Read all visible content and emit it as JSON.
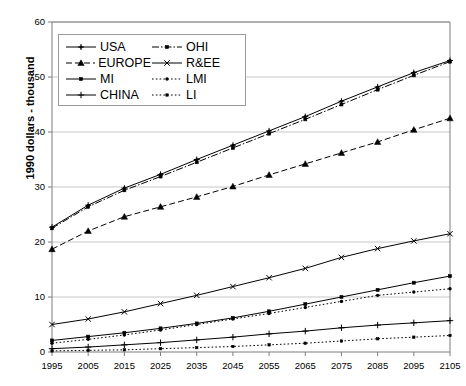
{
  "chart_data": {
    "type": "line",
    "title": "",
    "xlabel": "",
    "ylabel": "1990 dollars - thousand",
    "x": [
      1995,
      2005,
      2015,
      2025,
      2035,
      2045,
      2055,
      2065,
      2075,
      2085,
      2095,
      2105
    ],
    "xticklabels": [
      "1995",
      "2005",
      "2015",
      "2025",
      "2035",
      "2045",
      "2055",
      "2065",
      "2075",
      "2085",
      "2095",
      "2105"
    ],
    "yticklabels": [
      "0",
      "10",
      "20",
      "30",
      "40",
      "50",
      "60"
    ],
    "yticks": [
      0,
      10,
      20,
      30,
      40,
      50,
      60
    ],
    "ylim": [
      0,
      60
    ],
    "xlim": [
      1995,
      2105
    ],
    "grid": "horizontal",
    "legend_position": "upper-left-inside",
    "series": [
      {
        "name": "USA",
        "marker": "plus-dot",
        "dash": "solid",
        "values": [
          22.7,
          26.7,
          29.8,
          32.3,
          35.0,
          37.6,
          40.2,
          42.8,
          45.6,
          48.2,
          50.8,
          53.0
        ]
      },
      {
        "name": "EUROPE",
        "marker": "triangle",
        "dash": "dashed",
        "values": [
          18.7,
          22.0,
          24.6,
          26.4,
          28.2,
          30.1,
          32.2,
          34.2,
          36.2,
          38.2,
          40.4,
          42.5
        ]
      },
      {
        "name": "MI",
        "marker": "square",
        "dash": "solid",
        "values": [
          2.1,
          2.8,
          3.5,
          4.3,
          5.2,
          6.2,
          7.4,
          8.7,
          10.0,
          11.3,
          12.6,
          13.8
        ]
      },
      {
        "name": "CHINA",
        "marker": "plus",
        "dash": "solid",
        "values": [
          0.6,
          0.9,
          1.3,
          1.7,
          2.2,
          2.7,
          3.3,
          3.8,
          4.4,
          4.9,
          5.3,
          5.7
        ]
      },
      {
        "name": "OHI",
        "marker": "square",
        "dash": "dash-dot",
        "values": [
          22.5,
          26.4,
          29.4,
          31.9,
          34.5,
          37.1,
          39.7,
          42.3,
          45.0,
          47.7,
          50.3,
          52.8
        ]
      },
      {
        "name": "R&EE",
        "marker": "cross",
        "dash": "solid",
        "values": [
          5.0,
          6.0,
          7.3,
          8.8,
          10.3,
          11.9,
          13.5,
          15.2,
          17.2,
          18.8,
          20.2,
          21.5
        ]
      },
      {
        "name": "LMI",
        "marker": "dot",
        "dash": "dotted",
        "values": [
          1.6,
          2.3,
          3.1,
          4.0,
          5.0,
          6.0,
          7.0,
          8.1,
          9.2,
          10.3,
          10.9,
          11.5
        ]
      },
      {
        "name": "LI",
        "marker": "small-square",
        "dash": "dotted",
        "values": [
          0.2,
          0.3,
          0.4,
          0.6,
          0.8,
          1.0,
          1.3,
          1.6,
          2.0,
          2.4,
          2.7,
          3.0
        ]
      }
    ]
  },
  "legend": {
    "entries": [
      {
        "label": "USA"
      },
      {
        "label": "OHI"
      },
      {
        "label": "EUROPE"
      },
      {
        "label": "R&EE"
      },
      {
        "label": "MI"
      },
      {
        "label": "LMI"
      },
      {
        "label": "CHINA"
      },
      {
        "label": "LI"
      }
    ]
  },
  "colors": {
    "line": "#000000",
    "grid": "#b9b9b9",
    "axis": "#7d7d7d",
    "text": "#000000",
    "legend_border": "#9a9a9a"
  }
}
